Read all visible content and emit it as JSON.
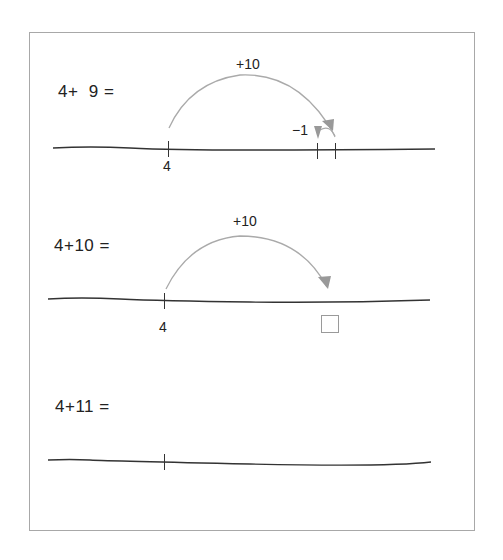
{
  "worksheet": {
    "exercises": [
      {
        "equation": "4+  9 =",
        "start_label": "4",
        "jumps": [
          {
            "label": "+10",
            "direction": "forward"
          },
          {
            "label": "−1",
            "direction": "backward"
          }
        ],
        "has_answer_box": false
      },
      {
        "equation": "4+10 =",
        "start_label": "4",
        "jumps": [
          {
            "label": "+10",
            "direction": "forward"
          }
        ],
        "has_answer_box": true
      },
      {
        "equation": "4+11 =",
        "start_label": "",
        "jumps": [],
        "has_answer_box": false
      }
    ]
  },
  "colors": {
    "arc": "#a9a9a9",
    "arrowhead": "#9a9a9a",
    "number_line": "#333333",
    "frame": "#a8a8a8",
    "text": "#222222"
  }
}
